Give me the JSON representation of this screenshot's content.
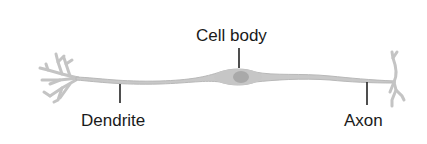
{
  "diagram": {
    "labels": {
      "cell_body": "Cell body",
      "dendrite": "Dendrite",
      "axon": "Axon"
    },
    "colors": {
      "neuron_fill": "#c8c8c8",
      "neuron_stroke": "#b0b0b0",
      "nucleus": "#a8a8a8",
      "leader_line": "#222222",
      "text": "#1a1a1a"
    }
  }
}
